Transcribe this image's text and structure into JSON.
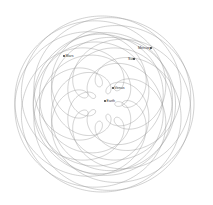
{
  "diagram": {
    "title": "",
    "frame": "geocentric",
    "bodies": [
      {
        "name": "Earth",
        "label": "Earth"
      },
      {
        "name": "Venus",
        "label": "Venus"
      },
      {
        "name": "Sun",
        "label": "Sun"
      },
      {
        "name": "Mercury",
        "label": "Mercury"
      },
      {
        "name": "Mars",
        "label": "Mars"
      }
    ],
    "paths": [
      {
        "body": "Venus",
        "color": "#9a9a9a"
      },
      {
        "body": "Mars",
        "color": "#9a9a9a"
      },
      {
        "body": "Mercury",
        "color": "#9a9a9a"
      }
    ]
  }
}
